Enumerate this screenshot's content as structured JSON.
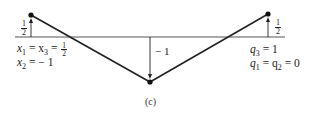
{
  "figure": {
    "caption": "(c)",
    "line_color": "#222222",
    "baseline": {
      "x1": 15,
      "x2": 285,
      "y": 37
    },
    "points": [
      {
        "name": "left",
        "x": 31,
        "y": 15,
        "value_label_num": "1",
        "value_label_den": "2"
      },
      {
        "name": "bottom",
        "x": 150,
        "y": 82,
        "value_label": "− 1"
      },
      {
        "name": "right",
        "x": 268,
        "y": 14,
        "value_label_num": "1",
        "value_label_den": "2"
      }
    ],
    "left_text": {
      "line1_prefix": "x",
      "line1_sub1": "1",
      "line1_mid": " = x",
      "line1_sub2": "3",
      "line1_eq": " = ",
      "line1_frac_num": "1",
      "line1_frac_den": "2",
      "line2_prefix": "x",
      "line2_sub": "2",
      "line2_rest": " = − 1"
    },
    "right_text": {
      "line1_prefix": "q",
      "line1_sub": "3",
      "line1_rest": " = 1",
      "line2_prefix": "q",
      "line2_sub1": "1",
      "line2_mid": " = q",
      "line2_sub2": "2",
      "line2_rest": " = 0"
    }
  }
}
